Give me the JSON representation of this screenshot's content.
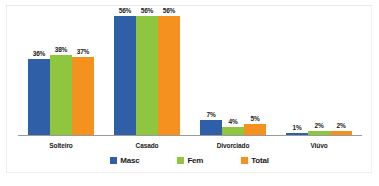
{
  "chart_data": {
    "type": "bar",
    "title": "",
    "subtitle": "",
    "xlabel": "",
    "ylabel": "",
    "ylim": [
      0,
      60
    ],
    "grid": false,
    "legend_position": "bottom",
    "value_suffix": "%",
    "categories": [
      "Solteiro",
      "Casado",
      "Divorciado",
      "Viúvo"
    ],
    "series": [
      {
        "name": "Masc",
        "color": "#2f5fa6",
        "values": [
          36,
          56,
          7,
          1
        ]
      },
      {
        "name": "Fem",
        "color": "#8fc63f",
        "values": [
          38,
          56,
          4,
          2
        ]
      },
      {
        "name": "Total",
        "color": "#f5911e",
        "values": [
          37,
          56,
          5,
          2
        ]
      }
    ],
    "data_labels": [
      [
        "36%",
        "38%",
        "37%"
      ],
      [
        "56%",
        "56%",
        "56%"
      ],
      [
        "7%",
        "4%",
        "5%"
      ],
      [
        "1%",
        "2%",
        "2%"
      ]
    ]
  },
  "legend": {
    "items": [
      {
        "label": "Masc",
        "color": "#2f5fa6"
      },
      {
        "label": "Fem",
        "color": "#8fc63f"
      },
      {
        "label": "Total",
        "color": "#f5911e"
      }
    ]
  },
  "axis": {
    "tick_labels": [
      "Solteiro",
      "Casado",
      "Divorciado",
      "Viúvo"
    ]
  },
  "colors": {
    "masc": "#2f5fa6",
    "fem": "#8fc63f",
    "total": "#f5911e",
    "axis": "#9a9a9a",
    "text": "#1a1a1a",
    "background": "#ffffff"
  }
}
